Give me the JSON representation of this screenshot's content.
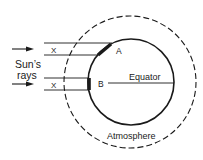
{
  "diagram": {
    "labels": {
      "suns_rays_line1": "Sun’s",
      "suns_rays_line2": "rays",
      "x_top": "X",
      "x_bottom": "X",
      "point_a": "A",
      "point_b": "B",
      "equator": "Equator",
      "atmosphere": "Atmosphere"
    },
    "colors": {
      "ink": "#1a1a1a",
      "background": "#ffffff"
    }
  }
}
